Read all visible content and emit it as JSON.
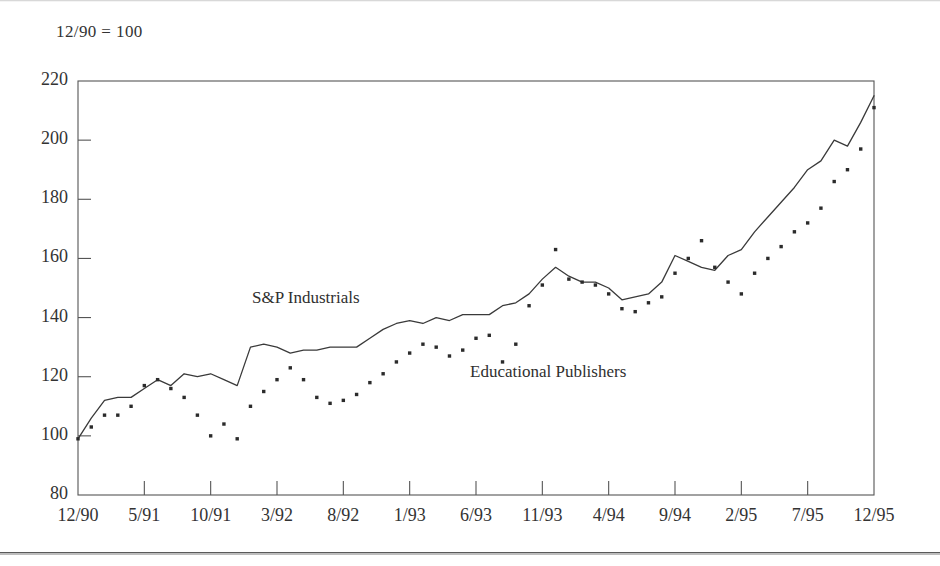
{
  "figure": {
    "index_note": "12/90 = 100",
    "background": "#ffffff",
    "line_color": "#3a3a3a",
    "dot_color": "#2b2b2b",
    "axis_color": "#555555"
  },
  "chart_data": {
    "type": "line",
    "title": "",
    "subtitle": "12/90 = 100",
    "xlabel": "",
    "ylabel": "",
    "ylim": [
      80,
      220
    ],
    "yticks": [
      80,
      100,
      120,
      140,
      160,
      180,
      200,
      220
    ],
    "xticks": [
      "12/90",
      "5/91",
      "10/91",
      "3/92",
      "8/92",
      "1/93",
      "6/93",
      "11/93",
      "4/94",
      "9/94",
      "2/95",
      "7/95",
      "12/95"
    ],
    "grid": false,
    "legend_position": "inline-annotation",
    "x_months": [
      "12/90",
      "1/91",
      "2/91",
      "3/91",
      "4/91",
      "5/91",
      "6/91",
      "7/91",
      "8/91",
      "9/91",
      "10/91",
      "11/91",
      "12/91",
      "1/92",
      "2/92",
      "3/92",
      "4/92",
      "5/92",
      "6/92",
      "7/92",
      "8/92",
      "9/92",
      "10/92",
      "11/92",
      "12/92",
      "1/93",
      "2/93",
      "3/93",
      "4/93",
      "5/93",
      "6/93",
      "7/93",
      "8/93",
      "9/93",
      "10/93",
      "11/93",
      "12/93",
      "1/94",
      "2/94",
      "3/94",
      "4/94",
      "5/94",
      "6/94",
      "7/94",
      "8/94",
      "9/94",
      "10/94",
      "11/94",
      "12/94",
      "1/95",
      "2/95",
      "3/95",
      "4/95",
      "5/95",
      "6/95",
      "7/95",
      "8/95",
      "9/95",
      "10/95",
      "11/95",
      "12/95"
    ],
    "series": [
      {
        "name": "S&P Industrials",
        "style": "solid-line",
        "values": [
          99,
          106,
          112,
          113,
          113,
          116,
          119,
          117,
          121,
          120,
          121,
          119,
          117,
          130,
          131,
          130,
          128,
          129,
          129,
          130,
          130,
          130,
          133,
          136,
          138,
          139,
          138,
          140,
          139,
          141,
          141,
          141,
          144,
          145,
          148,
          153,
          157,
          154,
          152,
          152,
          150,
          146,
          147,
          148,
          152,
          161,
          159,
          157,
          156,
          161,
          163,
          169,
          174,
          179,
          184,
          190,
          193,
          200,
          198,
          206,
          215
        ]
      },
      {
        "name": "Educational Publishers",
        "style": "dotted",
        "values": [
          99,
          103,
          107,
          107,
          110,
          117,
          119,
          116,
          113,
          107,
          100,
          104,
          99,
          110,
          115,
          119,
          123,
          119,
          113,
          111,
          112,
          114,
          118,
          121,
          125,
          128,
          131,
          130,
          127,
          129,
          133,
          134,
          125,
          131,
          144,
          151,
          163,
          153,
          152,
          151,
          148,
          143,
          142,
          145,
          147,
          155,
          160,
          166,
          157,
          152,
          148,
          155,
          160,
          164,
          169,
          172,
          177,
          186,
          190,
          197,
          211
        ]
      }
    ]
  },
  "annotations": [
    {
      "name": "S&P Industrials",
      "text": "S&P Industrials"
    },
    {
      "name": "Educational Publishers",
      "text": "Educational Publishers"
    }
  ]
}
